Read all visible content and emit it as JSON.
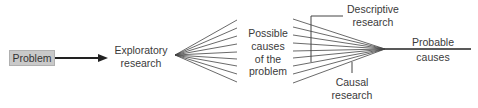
{
  "diagram": {
    "nodes": {
      "problem": "Problem",
      "exploratory_line1": "Exploratory",
      "exploratory_line2": "research",
      "possible_line1": "Possible",
      "possible_line2": "causes",
      "possible_line3": "of the",
      "possible_line4": "problem",
      "descriptive_line1": "Descriptive",
      "descriptive_line2": "research",
      "causal_line1": "Causal",
      "causal_line2": "research",
      "probable_line1": "Probable",
      "probable_line2": "causes"
    },
    "edges": [
      {
        "from": "Problem",
        "to": "Exploratory research",
        "type": "arrow"
      },
      {
        "from": "Exploratory research",
        "to": "Possible causes of the problem",
        "type": "fan-out",
        "count": 9
      },
      {
        "from": "Possible causes of the problem",
        "to": "Probable causes",
        "type": "fan-in",
        "count": 9
      },
      {
        "from": "Descriptive research",
        "to": "fan-in lines",
        "type": "bracket"
      },
      {
        "from": "Causal research",
        "to": "fan-in lines",
        "type": "tick"
      }
    ],
    "colors": {
      "box_fill": "#c9c9c9",
      "line": "#333333",
      "text": "#3a3a3a"
    }
  }
}
